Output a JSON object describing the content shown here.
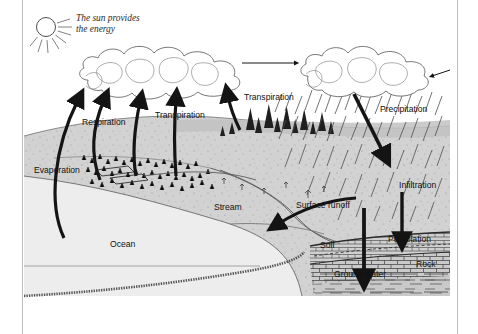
{
  "figure": {
    "sun_caption_line1": "The sun provides",
    "sun_caption_line2": "the energy",
    "labels": {
      "evaporation": "Evaporation",
      "respiration": "Respiration",
      "transpiration_left": "Transpiration",
      "transpiration_right": "Transpiration",
      "precipitation": "Precipitation",
      "infiltration": "Infiltration",
      "percolation": "Percolation",
      "surface_runoff": "Surface runoff",
      "stream": "Stream",
      "ocean": "Ocean",
      "soil": "Soil",
      "rock": "Rock",
      "ground_water": "Ground water"
    },
    "icons": {
      "sun": "sun-icon",
      "cloud_left": "cloud-icon",
      "cloud_right": "cloud-icon",
      "rain": "rain-streaks-icon",
      "trees": "conifer-trees-icon",
      "arrow_evaporation": "arrow-up-icon",
      "arrow_respiration": "arrow-up-icon",
      "arrow_transpiration_left": "arrow-up-icon",
      "arrow_transpiration_right": "arrow-up-icon",
      "arrow_wind": "arrow-right-icon",
      "arrow_precipitation": "arrow-down-icon",
      "arrow_infiltration": "arrow-down-icon",
      "arrow_percolation": "arrow-down-icon",
      "arrow_runoff": "arrow-curved-left-icon"
    },
    "colors": {
      "land": "#d2d2d2",
      "land_dark": "#b9b9b9",
      "ocean": "#ededed",
      "sky": "#ffffff",
      "ink": "#141414",
      "border": "#bcbcbc"
    }
  }
}
